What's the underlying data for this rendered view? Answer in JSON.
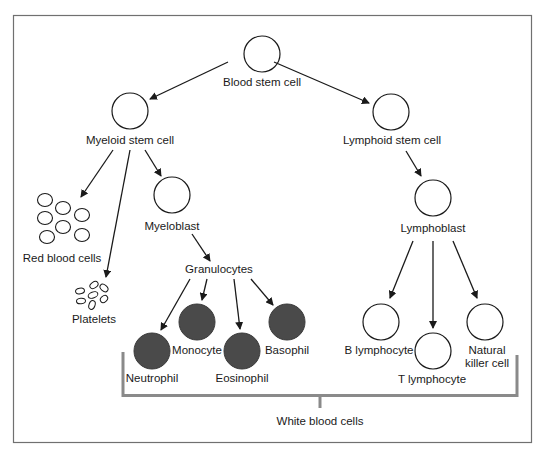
{
  "colors": {
    "frame": "#707070",
    "bracket": "#8a8a8a",
    "ink": "#1a1a1a",
    "dark_cell": "#4a4a4a"
  },
  "nodes": {
    "blood_stem_cell": "Blood stem cell",
    "myeloid_stem_cell": "Myeloid stem cell",
    "lymphoid_stem_cell": "Lymphoid stem cell",
    "red_blood_cells": "Red blood cells",
    "platelets": "Platelets",
    "myeloblast": "Myeloblast",
    "granulocytes": "Granulocytes",
    "neutrophil": "Neutrophil",
    "monocyte": "Monocyte",
    "eosinophil": "Eosinophil",
    "basophil": "Basophil",
    "lymphoblast": "Lymphoblast",
    "b_lymphocyte": "B lymphocyte",
    "t_lymphocyte": "T lymphocyte",
    "natural_killer_line1": "Natural",
    "natural_killer_line2": "killer cell",
    "white_blood_cells": "White blood cells"
  },
  "edges": [
    [
      "Blood stem cell",
      "Myeloid stem cell"
    ],
    [
      "Blood stem cell",
      "Lymphoid stem cell"
    ],
    [
      "Myeloid stem cell",
      "Red blood cells"
    ],
    [
      "Myeloid stem cell",
      "Platelets"
    ],
    [
      "Myeloid stem cell",
      "Myeloblast"
    ],
    [
      "Myeloblast",
      "Granulocytes"
    ],
    [
      "Granulocytes",
      "Neutrophil"
    ],
    [
      "Granulocytes",
      "Monocyte"
    ],
    [
      "Granulocytes",
      "Eosinophil"
    ],
    [
      "Granulocytes",
      "Basophil"
    ],
    [
      "Lymphoid stem cell",
      "Lymphoblast"
    ],
    [
      "Lymphoblast",
      "B lymphocyte"
    ],
    [
      "Lymphoblast",
      "T lymphocyte"
    ],
    [
      "Lymphoblast",
      "Natural killer cell"
    ]
  ]
}
